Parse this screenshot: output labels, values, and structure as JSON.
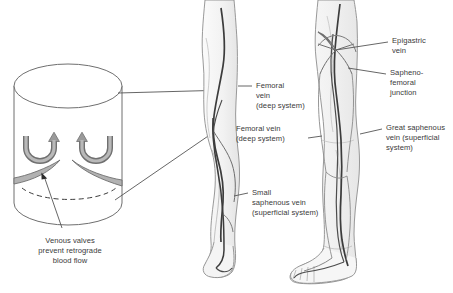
{
  "figure": {
    "colors": {
      "background": "#ffffff",
      "outline": "#7a7a7a",
      "vein_dark": "#3c3c3c",
      "vein_light": "#8a8a8a",
      "valve_fill": "#b2b2b2",
      "valve_stroke": "#6e6e6e",
      "leader": "#555555",
      "text": "#3a3a3a",
      "skin_fill": "#f4f4f4",
      "skin_shade": "#e9e9e9"
    },
    "panels": [
      {
        "name": "venous-valve-detail",
        "caption_lines": [
          "Venous valves",
          "prevent retrograde",
          "blood flow"
        ]
      },
      {
        "name": "posterior-leg-view"
      },
      {
        "name": "anterior-leg-view"
      }
    ]
  },
  "labels": {
    "femoral_vein_deep_mid": {
      "lines": [
        "Femoral",
        "vein",
        "(deep system)"
      ]
    },
    "femoral_vein_deep_right": {
      "lines": [
        "Femoral vein",
        "(deep system)"
      ]
    },
    "small_saphenous": {
      "lines": [
        "Small",
        "saphenous vein",
        "(superficial system)"
      ]
    },
    "epigastric_vein": {
      "lines": [
        "Epigastric",
        "vein"
      ]
    },
    "sapheno_femoral_junction": {
      "lines": [
        "Sapheno-",
        "femoral",
        "junction"
      ]
    },
    "great_saphenous": {
      "lines": [
        "Great saphenous",
        "vein (superficial",
        "system)"
      ]
    },
    "valve_caption": {
      "lines": [
        "Venous valves",
        "prevent retrograde",
        "blood flow"
      ]
    }
  }
}
